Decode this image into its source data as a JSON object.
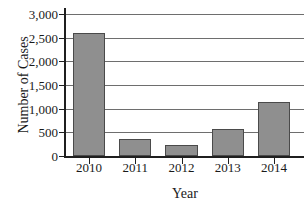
{
  "chart_data": {
    "type": "bar",
    "title": "",
    "xlabel": "Year",
    "ylabel": "Number of Cases",
    "categories": [
      "2010",
      "2011",
      "2012",
      "2013",
      "2014"
    ],
    "values": [
      2600,
      370,
      230,
      580,
      1150
    ],
    "ylim": [
      0,
      3000
    ],
    "ytick_values": [
      0,
      500,
      1000,
      1500,
      2000,
      2500,
      3000
    ],
    "ytick_labels": [
      "0",
      "500",
      "1,000",
      "1,500",
      "2,000",
      "2,500",
      "3,000"
    ],
    "grid": "horizontal",
    "legend": "none",
    "bar_color": "#8f8f8f",
    "bar_edge_color": "#4a4a4a",
    "axis_color": "#1f1f1f",
    "gridline_color": "#6e6e6e",
    "background_color": "#ffffff"
  }
}
